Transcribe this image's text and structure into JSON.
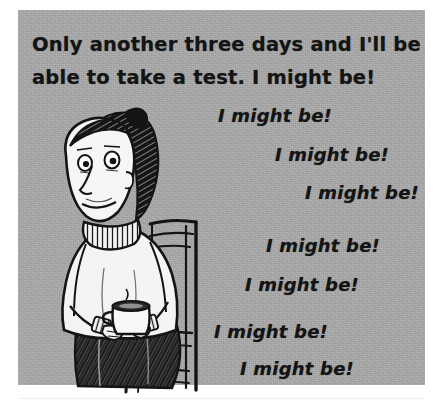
{
  "image": {
    "kind": "cartoon-panel",
    "medium": "pen-and-ink line drawing on gray paper",
    "palette": {
      "page_background": "#ffffff",
      "panel_background": "#a9a9a9",
      "ink": "#141414",
      "highlight_white": "#f2f2f2",
      "rule": "#ededf1"
    }
  },
  "caption": {
    "line1": "Only another three days and I'll be",
    "line2": "able to take a test.  I might be!"
  },
  "refrains": [
    {
      "text": "I might be!",
      "x": 218,
      "y": 122
    },
    {
      "text": "I might be!",
      "x": 275,
      "y": 161
    },
    {
      "text": "I might be!",
      "x": 305,
      "y": 199
    },
    {
      "text": "I might be!",
      "x": 266,
      "y": 252
    },
    {
      "text": "I might be!",
      "x": 245,
      "y": 291
    },
    {
      "text": "I might be!",
      "x": 214,
      "y": 338
    },
    {
      "text": "I might be!",
      "x": 240,
      "y": 375
    }
  ],
  "figure": {
    "parts": [
      "hair-ponytail",
      "face",
      "eyes",
      "nose",
      "smile",
      "ribbed-turtleneck-collar",
      "sweater-torso",
      "arms",
      "hands",
      "mug",
      "steam",
      "trousers",
      "chair"
    ]
  }
}
